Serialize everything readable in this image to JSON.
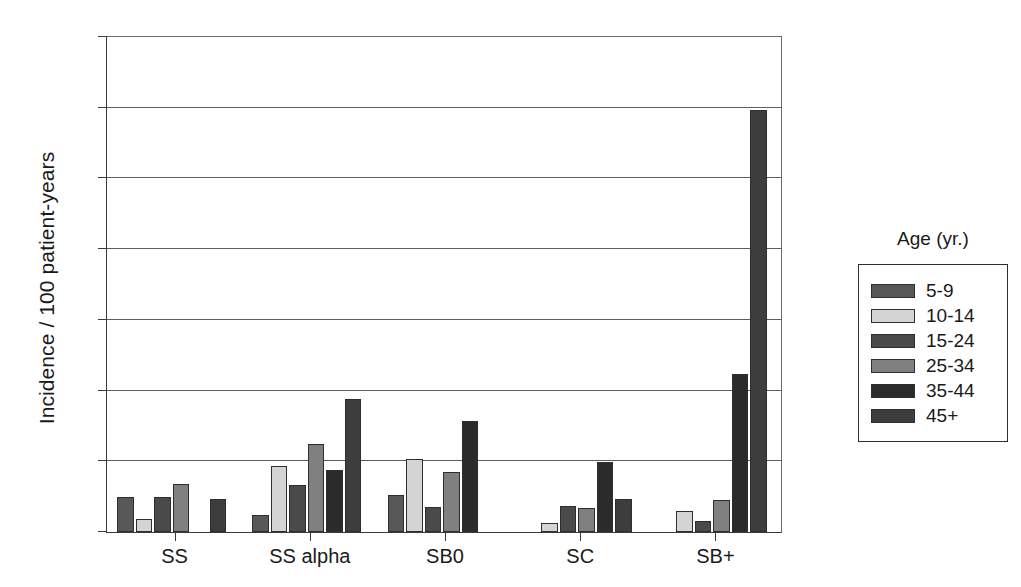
{
  "chart_data": {
    "type": "bar",
    "title": "",
    "xlabel": "",
    "ylabel": "Incidence / 100 patient-years",
    "ylim": [
      0,
      35
    ],
    "yticks": [
      0,
      5,
      10,
      15,
      20,
      25,
      30,
      35
    ],
    "grid": true,
    "legend_position": "right",
    "legend_title": "Age (yr.)",
    "categories": [
      "SS",
      "SS alpha",
      "SB0",
      "SC",
      "SB+"
    ],
    "series": [
      {
        "name": "5-9",
        "color": "#585858",
        "values": [
          2.5,
          1.2,
          2.6,
          null,
          null
        ]
      },
      {
        "name": "10-14",
        "color": "#d4d4d4",
        "values": [
          0.9,
          4.65,
          5.15,
          0.65,
          1.5
        ]
      },
      {
        "name": "15-24",
        "color": "#4a4a4a",
        "values": [
          2.5,
          3.3,
          1.75,
          1.85,
          0.75
        ]
      },
      {
        "name": "25-34",
        "color": "#808080",
        "values": [
          3.4,
          6.2,
          4.25,
          1.7,
          2.25
        ]
      },
      {
        "name": "35-44",
        "color": "#2b2b2b",
        "values": [
          null,
          4.4,
          7.85,
          4.9,
          11.1
        ]
      },
      {
        "name": "45+",
        "color": "#3d3d3d",
        "values": [
          2.3,
          9.35,
          null,
          2.3,
          29.7
        ]
      }
    ]
  },
  "legend": {
    "title": "Age (yr.)",
    "items": [
      {
        "label": "5-9",
        "color": "#585858"
      },
      {
        "label": "10-14",
        "color": "#d4d4d4"
      },
      {
        "label": "15-24",
        "color": "#4a4a4a"
      },
      {
        "label": "25-34",
        "color": "#808080"
      },
      {
        "label": "35-44",
        "color": "#2b2b2b"
      },
      {
        "label": "45+",
        "color": "#3d3d3d"
      }
    ]
  },
  "axes": {
    "y_title": "Incidence / 100 patient-years",
    "y_tick_labels": [
      "0",
      "5",
      "10",
      "15",
      "20",
      "25",
      "30",
      "35"
    ],
    "x_tick_labels": [
      "SS",
      "SS alpha",
      "SB0",
      "SC",
      "SB+"
    ]
  }
}
